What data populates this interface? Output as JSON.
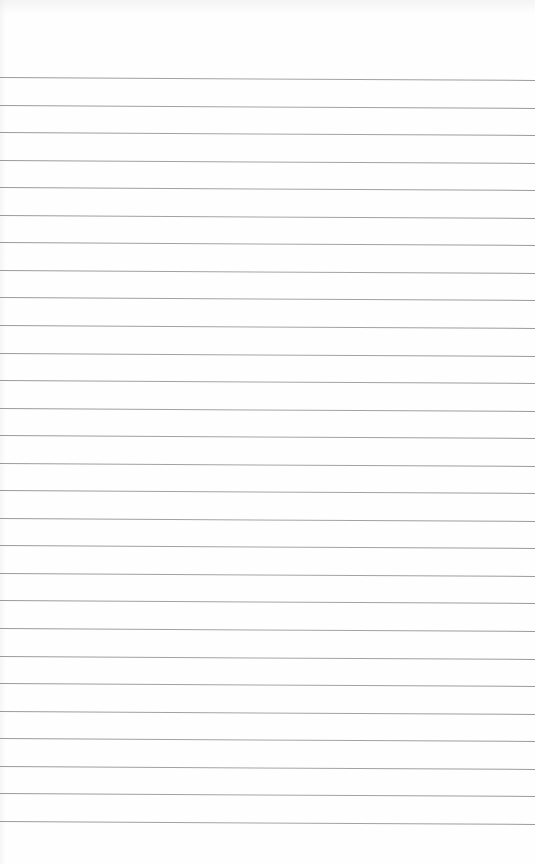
{
  "page": {
    "type": "lined-notebook-paper",
    "background_color": "#fefefe",
    "line_color": "#9a9a9a",
    "line_count": 28,
    "first_line_y": 77,
    "line_spacing": 27.55,
    "line_slope_px_across_width": 3,
    "text_content": ""
  }
}
